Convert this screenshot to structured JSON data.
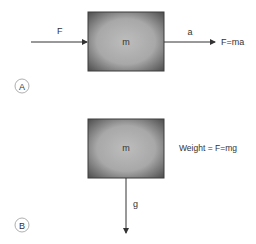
{
  "panels": [
    {
      "id": "A",
      "marker": "A",
      "mass_label": "m",
      "force_label": "F",
      "accel_label": "a",
      "equation": "F=ma"
    },
    {
      "id": "B",
      "marker": "B",
      "mass_label": "m",
      "equation": "Weight = F=mg",
      "gravity_label": "g"
    }
  ],
  "colors": {
    "box_edge": "#505050",
    "box_center": "#b4b4b4",
    "arrow": "#333333",
    "text": "#333333",
    "marker_circle": "#999999"
  }
}
